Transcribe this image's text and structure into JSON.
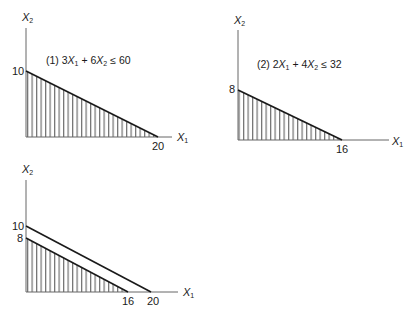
{
  "panels": [
    {
      "id": "panel-1",
      "equation": {
        "prefix": "(1) ",
        "c1": "3",
        "c2": "6",
        "op": "+",
        "rel": "≤",
        "rhs": "60"
      },
      "x_axis_label": "X",
      "x_axis_sub": "1",
      "y_axis_label": "X",
      "y_axis_sub": "2",
      "x_intercept": "20",
      "y_intercept": "10"
    },
    {
      "id": "panel-2",
      "equation": {
        "prefix": "(2) ",
        "c1": "2",
        "c2": "4",
        "op": "+",
        "rel": "≤",
        "rhs": "32"
      },
      "x_axis_label": "X",
      "x_axis_sub": "1",
      "y_axis_label": "X",
      "y_axis_sub": "2",
      "x_intercept": "16",
      "y_intercept": "8"
    },
    {
      "id": "panel-3",
      "x_axis_label": "X",
      "x_axis_sub": "1",
      "y_axis_label": "X",
      "y_axis_sub": "2",
      "x_intercepts": [
        "16",
        "20"
      ],
      "y_intercepts": [
        "10",
        "8"
      ]
    }
  ],
  "colors": {
    "line": "#1a1a1a",
    "axis": "#666666",
    "hatch": "#333333"
  }
}
